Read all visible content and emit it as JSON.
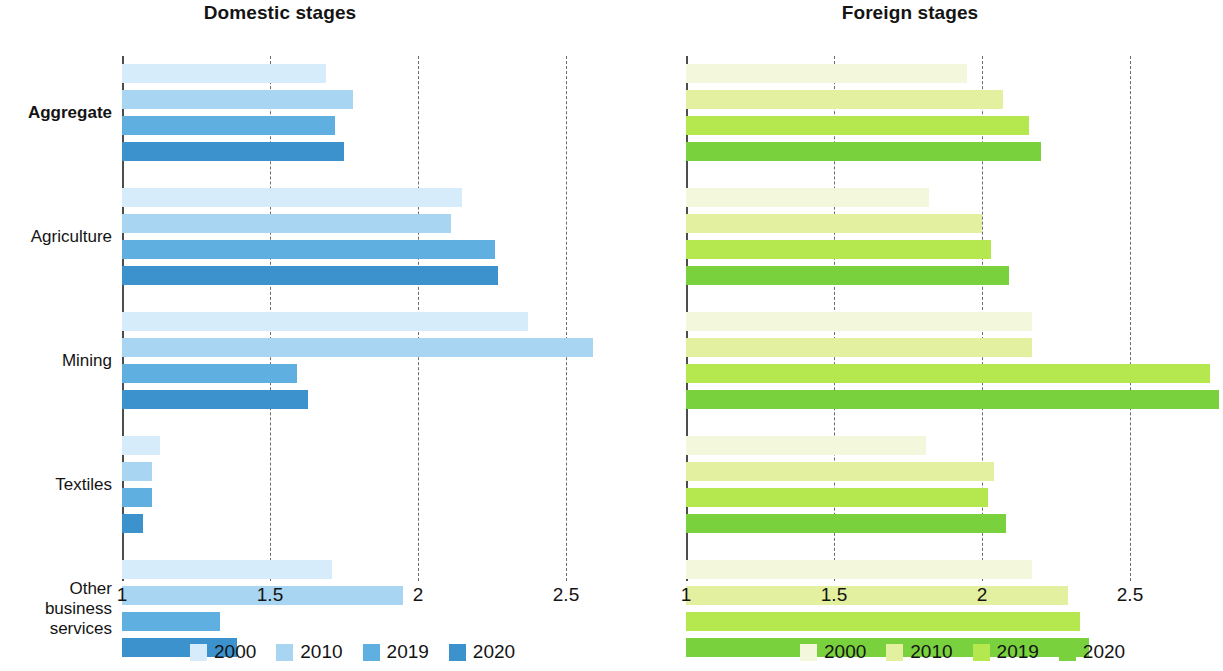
{
  "figure": {
    "panels": [
      {
        "title": "Domestic stages"
      },
      {
        "title": "Foreign stages"
      }
    ],
    "legend_years": [
      "2000",
      "2010",
      "2019",
      "2020"
    ],
    "legend_colors_domestic": [
      "#d6ecfa",
      "#a8d5f2",
      "#5fb0e0",
      "#3b92cc"
    ],
    "legend_colors_foreign": [
      "#f3f8dd",
      "#e2f0a0",
      "#b5e84f",
      "#7ad13e"
    ],
    "tick_labels": [
      "1",
      "1.5",
      "2",
      "2.5"
    ]
  },
  "chart_data": [
    {
      "type": "bar",
      "orientation": "horizontal",
      "title": "Domestic stages",
      "xlabel": "",
      "ylabel": "",
      "xlim": [
        1,
        2.6
      ],
      "xticks": [
        1,
        1.5,
        2,
        2.5
      ],
      "grid": true,
      "legend_position": "bottom",
      "categories": [
        "Aggregate",
        "Agriculture",
        "Mining",
        "Textiles",
        "Other business services"
      ],
      "series": [
        {
          "name": "2000",
          "color": "#d6ecfa",
          "values": [
            1.69,
            2.15,
            2.37,
            1.13,
            1.71
          ]
        },
        {
          "name": "2010",
          "color": "#a8d5f2",
          "values": [
            1.78,
            2.11,
            2.59,
            1.1,
            1.95
          ]
        },
        {
          "name": "2019",
          "color": "#5fb0e0",
          "values": [
            1.72,
            2.26,
            1.59,
            1.1,
            1.33
          ]
        },
        {
          "name": "2020",
          "color": "#3b92cc",
          "values": [
            1.75,
            2.27,
            1.63,
            1.07,
            1.39
          ]
        }
      ]
    },
    {
      "type": "bar",
      "orientation": "horizontal",
      "title": "Foreign stages",
      "xlabel": "",
      "ylabel": "",
      "xlim": [
        1,
        2.85
      ],
      "xticks": [
        1,
        1.5,
        2,
        2.5
      ],
      "grid": true,
      "legend_position": "bottom",
      "categories": [
        "Aggregate",
        "Agriculture",
        "Mining",
        "Textiles",
        "Other business services"
      ],
      "series": [
        {
          "name": "2000",
          "color": "#f3f8dd",
          "values": [
            1.95,
            1.82,
            2.17,
            1.81,
            2.17
          ]
        },
        {
          "name": "2010",
          "color": "#e2f0a0",
          "values": [
            2.07,
            2.0,
            2.17,
            2.04,
            2.29
          ]
        },
        {
          "name": "2019",
          "color": "#b5e84f",
          "values": [
            2.16,
            2.03,
            2.77,
            2.02,
            2.33
          ]
        },
        {
          "name": "2020",
          "color": "#7ad13e",
          "values": [
            2.2,
            2.09,
            2.8,
            2.08,
            2.36
          ]
        }
      ]
    }
  ],
  "category_labels": [
    {
      "text": "Aggregate",
      "bold": true
    },
    {
      "text": "Agriculture",
      "bold": false
    },
    {
      "text": "Mining",
      "bold": false
    },
    {
      "text": "Textiles",
      "bold": false
    },
    {
      "text": "Other\nbusiness\nservices",
      "bold": false
    }
  ]
}
